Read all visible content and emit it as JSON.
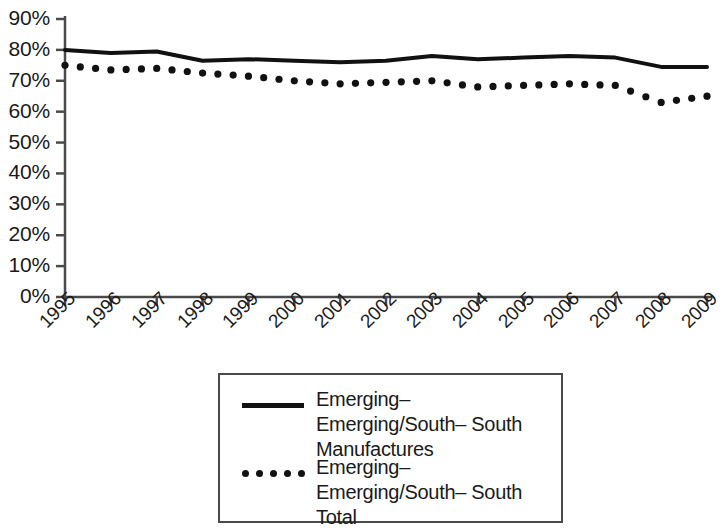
{
  "chart_data": {
    "type": "line",
    "title": "",
    "subtitle": "",
    "xlabel": "",
    "ylabel": "",
    "grid": false,
    "legend_position": "bottom-center",
    "categories": [
      "1995",
      "1996",
      "1997",
      "1998",
      "1999",
      "2000",
      "2001",
      "2002",
      "2003",
      "2004",
      "2005",
      "2006",
      "2007",
      "2008",
      "2009"
    ],
    "x": [
      1995,
      1996,
      1997,
      1998,
      1999,
      2000,
      2001,
      2002,
      2003,
      2004,
      2005,
      2006,
      2007,
      2008,
      2009
    ],
    "ylim": [
      0,
      90
    ],
    "y_tick_labels": [
      "0%",
      "10%",
      "20%",
      "30%",
      "40%",
      "50%",
      "60%",
      "70%",
      "80%",
      "90%"
    ],
    "y_tick_values": [
      0,
      10,
      20,
      30,
      40,
      50,
      60,
      70,
      80,
      90
    ],
    "x_tick_labels": [
      "1995",
      "1996",
      "1997",
      "1998",
      "1999",
      "2000",
      "2001",
      "2002",
      "2003",
      "2004",
      "2005",
      "2006",
      "2007",
      "2008",
      "2009"
    ],
    "series": [
      {
        "name": "Emerging–Emerging/South–South Manufactures",
        "style": "solid",
        "color": "#111111",
        "values": [
          80.0,
          79.0,
          79.5,
          76.5,
          77.0,
          76.5,
          76.0,
          76.5,
          78.0,
          77.0,
          77.5,
          78.0,
          77.5,
          74.5,
          74.5
        ]
      },
      {
        "name": "Emerging–Emerging/South–South Total",
        "style": "dotted",
        "color": "#111111",
        "values": [
          75.0,
          73.5,
          74.0,
          72.5,
          71.5,
          70.0,
          69.0,
          69.5,
          70.0,
          68.0,
          68.5,
          69.0,
          68.5,
          63.0,
          65.0
        ]
      }
    ]
  },
  "axes": {
    "y_labels": [
      "90%",
      "80%",
      "70%",
      "60%",
      "50%",
      "40%",
      "30%",
      "20%",
      "10%",
      "0%"
    ],
    "x_labels": [
      "1995",
      "1996",
      "1997",
      "1998",
      "1999",
      "2000",
      "2001",
      "2002",
      "2003",
      "2004",
      "2005",
      "2006",
      "2007",
      "2008",
      "2009"
    ]
  },
  "legend": {
    "entries": [
      {
        "label_line1": "Emerging–Emerging/South–",
        "label_line2": "South Manufactures",
        "sample": "solid-line-sample"
      },
      {
        "label_line1": "Emerging–Emerging/South–",
        "label_line2": "South Total",
        "sample": "dotted-line-sample"
      }
    ]
  },
  "colors": {
    "series_ink": "#111111",
    "axis": "#4a4a4a",
    "background": "#ffffff",
    "text": "#1a1a1a"
  }
}
